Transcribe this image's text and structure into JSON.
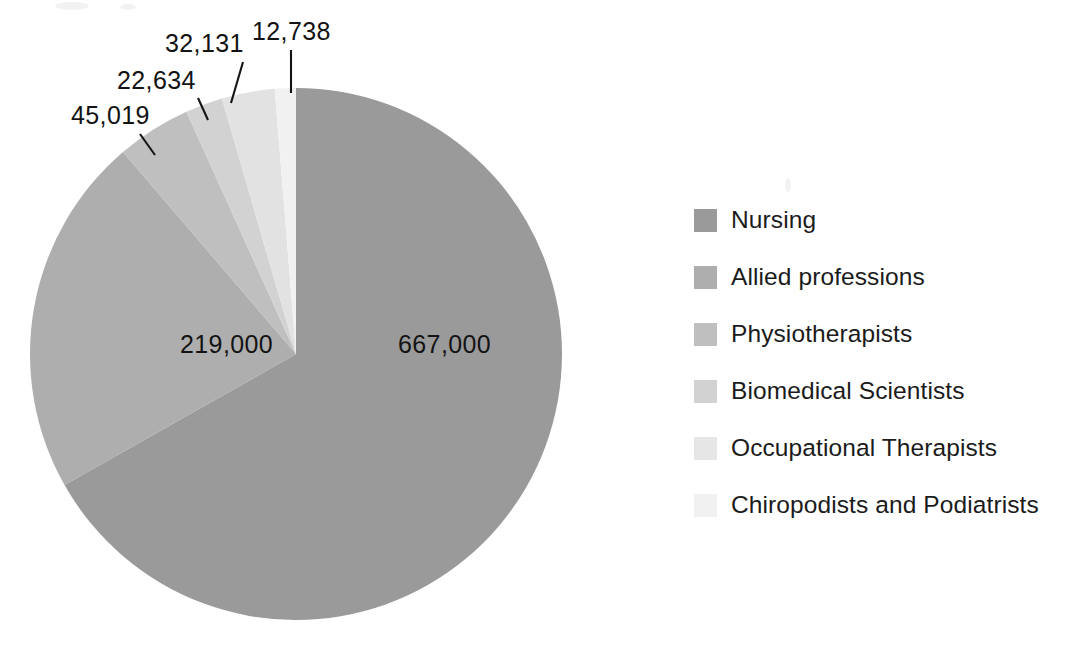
{
  "chart_data": {
    "type": "pie",
    "title": "",
    "subtitle": "",
    "xlabel": "",
    "ylabel": "",
    "grid": false,
    "legend_position": "right",
    "start_angle_deg": 0,
    "direction": "clockwise",
    "total": 998522,
    "categories": [
      "Nursing",
      "Allied professions",
      "Physiotherapists",
      "Biomedical Scientists",
      "Occupational Therapists",
      "Chiropodists and Podiatrists"
    ],
    "values": [
      667000,
      219000,
      45019,
      22634,
      32131,
      12738
    ],
    "value_labels": [
      "667,000",
      "219,000",
      "45,019",
      "22,634",
      "32,131",
      "12,738"
    ],
    "colors": [
      "#9a9a9a",
      "#aeaeae",
      "#bfbfbf",
      "#d2d2d2",
      "#e2e2e2",
      "#f1f1f1"
    ],
    "slices": [
      {
        "name": "Nursing",
        "value": 667000,
        "label": "667,000",
        "color": "#9a9a9a",
        "label_placement": "inside",
        "label_x": 398,
        "label_y": 353
      },
      {
        "name": "Allied professions",
        "value": 219000,
        "label": "219,000",
        "color": "#aeaeae",
        "label_placement": "inside",
        "label_x": 180,
        "label_y": 353
      },
      {
        "name": "Physiotherapists",
        "value": 45019,
        "label": "45,019",
        "color": "#bfbfbf",
        "label_placement": "callout",
        "label_x": 71,
        "label_y": 124,
        "leader_x1": 140,
        "leader_y1": 134,
        "leader_x2": 155,
        "leader_y2": 155
      },
      {
        "name": "Biomedical Scientists",
        "value": 22634,
        "label": "22,634",
        "color": "#d2d2d2",
        "label_placement": "callout",
        "label_x": 117,
        "label_y": 89,
        "leader_x1": 198,
        "leader_y1": 98,
        "leader_x2": 208,
        "leader_y2": 120
      },
      {
        "name": "Occupational Therapists",
        "value": 32131,
        "label": "32,131",
        "color": "#e2e2e2",
        "label_placement": "callout",
        "label_x": 165,
        "label_y": 52,
        "leader_x1": 243,
        "leader_y1": 62,
        "leader_x2": 231,
        "leader_y2": 103
      },
      {
        "name": "Chiropodists and Podiatrists",
        "value": 12738,
        "label": "12,738",
        "color": "#f1f1f1",
        "label_placement": "callout",
        "label_x": 252,
        "label_y": 40,
        "leader_x1": 291,
        "leader_y1": 50,
        "leader_x2": 291,
        "leader_y2": 93
      }
    ],
    "geometry": {
      "center_x": 296,
      "center_y": 354,
      "radius": 266
    }
  },
  "legend": {
    "items": [
      {
        "label": "Nursing",
        "color": "#9a9a9a"
      },
      {
        "label": "Allied professions",
        "color": "#aeaeae"
      },
      {
        "label": "Physiotherapists",
        "color": "#bfbfbf"
      },
      {
        "label": "Biomedical Scientists",
        "color": "#d2d2d2"
      },
      {
        "label": "Occupational Therapists",
        "color": "#e6e6e6"
      },
      {
        "label": "Chiropodists and Podiatrists",
        "color": "#f0f0f0"
      }
    ]
  }
}
